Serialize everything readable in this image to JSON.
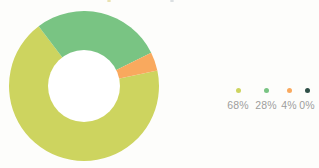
{
  "chart_data": {
    "type": "pie",
    "variant": "donut",
    "title": "",
    "subtitle": "",
    "xlabel": "",
    "ylabel": "",
    "legend_position": "right",
    "grid": false,
    "hole_ratio": 0.48,
    "start_angle_deg": -12,
    "categories": [
      "68%",
      "28%",
      "4%",
      "0%"
    ],
    "values": [
      68,
      28,
      4,
      0
    ],
    "labels": [
      "68%",
      "28%",
      "4%",
      "0%"
    ],
    "colors": [
      "#cdd45f",
      "#79c483",
      "#f9a95e",
      "#2f4f47"
    ],
    "slices": [
      {
        "label": "68%",
        "value": 68,
        "color": "#cdd45f"
      },
      {
        "label": "28%",
        "value": 28,
        "color": "#79c483"
      },
      {
        "label": "4%",
        "value": 4,
        "color": "#f9a95e"
      },
      {
        "label": "0%",
        "value": 0,
        "color": "#2f4f47"
      }
    ]
  },
  "legend": {
    "items": [
      {
        "label": "68%",
        "color": "#cdd45f",
        "swatch": "dot-swatch"
      },
      {
        "label": "28%",
        "color": "#79c483",
        "swatch": "dot-swatch"
      },
      {
        "label": "4%",
        "color": "#f9a95e",
        "swatch": "dot-swatch"
      },
      {
        "label": "0%",
        "color": "#2f4f47",
        "swatch": "dot-swatch"
      }
    ]
  },
  "theme": {
    "background": "#fdfdfb",
    "legend_text": "#9d9d9d"
  }
}
